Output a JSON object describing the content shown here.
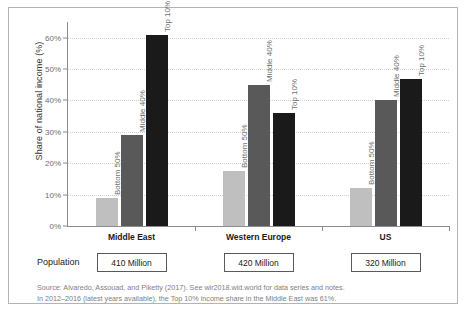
{
  "chart_data": {
    "type": "bar",
    "title": "",
    "xlabel": "",
    "ylabel": "Share of national income (%)",
    "ylim": [
      0,
      65
    ],
    "yticks": [
      "0%",
      "10%",
      "20%",
      "30%",
      "40%",
      "50%",
      "60%"
    ],
    "ytick_values": [
      0,
      10,
      20,
      30,
      40,
      50,
      60
    ],
    "grid": true,
    "legend": "none",
    "categories": [
      "Middle East",
      "Western Europe",
      "US"
    ],
    "series": [
      {
        "name": "Bottom 50%",
        "values": [
          9,
          17.5,
          12
        ],
        "color": "#bfbfbf"
      },
      {
        "name": "Middle 40%",
        "values": [
          29,
          45,
          40
        ],
        "color": "#595959"
      },
      {
        "name": "Top 10%",
        "values": [
          61,
          36,
          47
        ],
        "color": "#1a1a1a"
      }
    ],
    "annotations": [
      "In 2012-2016 (latest years available), the Top 10% income share in the Middle East was 61%."
    ]
  },
  "population_row": {
    "label": "Population",
    "values": [
      "410 Million",
      "420 Million",
      "320 Million"
    ]
  },
  "notes": {
    "line1": "Source: Alvaredo, Assouad, and Piketty (2017). See wir2018.wid.world for data series and notes.",
    "line2": "In 2012–2016 (latest years available), the Top 10% income share in the Middle East was 61%."
  }
}
